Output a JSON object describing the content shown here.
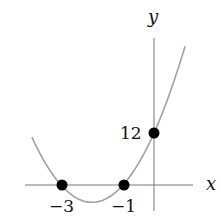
{
  "chart_data": {
    "type": "line",
    "title": "",
    "xlabel": "x",
    "ylabel": "y",
    "function": "y = 4(x+1)(x+3)",
    "xlim": [
      -4.0,
      1.0
    ],
    "series": [
      {
        "name": "parabola",
        "color": "#9a9a9a",
        "x": [
          -3.94,
          -3.5,
          -3,
          -2.5,
          -2,
          -1.5,
          -1,
          -0.5,
          0,
          0.5,
          1
        ],
        "y": [
          11.6,
          5,
          0,
          -3,
          -4,
          -3,
          0,
          5,
          12,
          21,
          32
        ]
      }
    ],
    "points": [
      {
        "x": -3,
        "y": 0,
        "label": "−3"
      },
      {
        "x": -1,
        "y": 0,
        "label": "−1"
      },
      {
        "x": 0,
        "y": 12,
        "label": "12"
      }
    ]
  },
  "labels": {
    "x_axis": "x",
    "y_axis": "y",
    "p1": "−3",
    "p2": "−1",
    "p3": "12"
  }
}
